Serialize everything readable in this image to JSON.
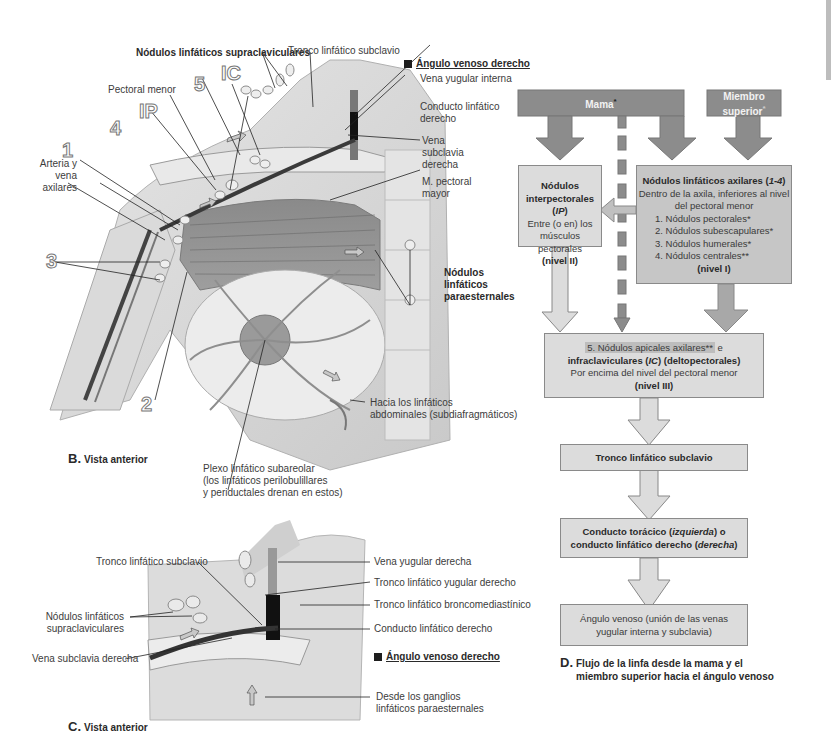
{
  "figure_b": {
    "caption_letter": "B.",
    "caption_text": "Vista anterior",
    "labels": {
      "supraclavicular_nodes": "Nódulos linfáticos supraclaviculares",
      "subclavian_trunk": "Tronco linfático subclavio",
      "venous_angle": "Ángulo venoso derecho",
      "internal_jugular": "Vena yugular interna",
      "right_lymph_duct_1": "Conducto linfático",
      "right_lymph_duct_2": "derecho",
      "subclavian_vein_1": "Vena",
      "subclavian_vein_2": "subclavia",
      "subclavian_vein_3": "derecha",
      "pec_major_1": "M. pectoral",
      "pec_major_2": "mayor",
      "parasternal_1": "Nódulos",
      "parasternal_2": "linfáticos",
      "parasternal_3": "paraesternales",
      "pec_minor": "Pectoral menor",
      "axillary_1": "Arteria y",
      "axillary_2": "vena",
      "axillary_3": "axilares",
      "abdominal_1": "Hacia los linfáticos",
      "abdominal_2": "abdominales (subdiafragmáticos)",
      "subareolar_1": "Plexo linfático subareolar",
      "subareolar_2": "(los linfáticos perilobulillares",
      "subareolar_3": "y periductales drenan en estos)"
    },
    "numbers": {
      "n1": "1",
      "n2": "2",
      "n3": "3",
      "n4": "4",
      "n5": "5",
      "ip": "IP",
      "ic": "IC"
    }
  },
  "figure_c": {
    "caption_letter": "C.",
    "caption_text": "Vista anterior",
    "labels": {
      "subclavian_trunk": "Tronco linfático subclavio",
      "supraclavicular_1": "Nódulos linfáticos",
      "supraclavicular_2": "supraclaviculares",
      "subclavian_vein": "Vena subclavia derecha",
      "jugular_vein": "Vena yugular derecha",
      "jugular_trunk": "Tronco linfático yugular derecho",
      "bronchomediastinal": "Tronco linfático broncomediastínico",
      "right_duct": "Conducto linfático derecho",
      "venous_angle": "Ángulo venoso derecho",
      "parasternal_1": "Desde los ganglios",
      "parasternal_2": "linfáticos paraesternales"
    }
  },
  "figure_d": {
    "caption_letter": "D.",
    "caption_line1": "Flujo de la linfa desde la mama y el",
    "caption_line2": "miembro superior hacia el ángulo venoso",
    "colors": {
      "dark": "#8c8c8c",
      "mid": "#a8a8a8",
      "light": "#dcdcdc",
      "border": "#8a8a8a"
    },
    "sources": {
      "breast": "Mama",
      "breast_mark": "*",
      "upper_limb_1": "Miembro",
      "upper_limb_2": "superior",
      "upper_limb_mark": "*"
    },
    "interpectoral": {
      "title_1": "Nódulos",
      "title_2": "interpectorales (",
      "title_abbr": "IP",
      "title_end": ")",
      "desc_1": "Entre (o en) los",
      "desc_2": "músculos pectorales",
      "level": "(nivel II)"
    },
    "axillary": {
      "title": "Nódulos linfáticos axilares (",
      "title_range": "1-4",
      "title_end": ")",
      "desc_1": "Dentro de la axila, inferiores al nivel",
      "desc_2": "del pectoral menor",
      "items": [
        "1. Nódulos pectorales*",
        "2. Nódulos subescapulares*",
        "3. Nódulos humerales*",
        "4. Nódulos centrales**"
      ],
      "level": "(nivel I)"
    },
    "apical": {
      "line1": "5. Nódulos apicales axilares**",
      "line1_tail": " e",
      "line2_a": "infraclaviculares (",
      "line2_abbr": "IC",
      "line2_b": ") (deltopectorales)",
      "desc": "Por encima del nivel del pectoral menor",
      "level": "(nivel III)"
    },
    "subclavian_trunk": "Tronco linfático subclavio",
    "duct": {
      "line1_a": "Conducto torácico (",
      "line1_it": "izquierda",
      "line1_b": ") o",
      "line2_a": "conducto linfático derecho (",
      "line2_it": "derecha",
      "line2_b": ")"
    },
    "venous_angle": {
      "line1": "Ángulo venoso (unión de las venas",
      "line2": "yugular interna y subclavia)"
    }
  }
}
